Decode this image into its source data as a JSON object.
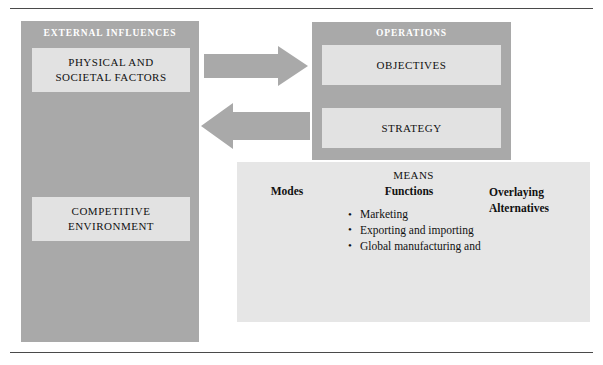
{
  "figure": {
    "rules": {
      "top": "horizontal-rule",
      "bottom": "horizontal-rule"
    }
  },
  "external_influences": {
    "title": "EXTERNAL INFLUENCES",
    "boxes": [
      {
        "id": "physical",
        "line1": "PHYSICAL AND",
        "line2": "SOCIETAL FACTORS"
      },
      {
        "id": "competitive",
        "line1": "COMPETITIVE",
        "line2": "ENVIRONMENT"
      }
    ]
  },
  "arrows": [
    {
      "name": "arrow-right",
      "direction": "right"
    },
    {
      "name": "arrow-left",
      "direction": "left"
    }
  ],
  "operations": {
    "title": "OPERATIONS",
    "boxes": [
      {
        "id": "objectives",
        "label": "OBJECTIVES"
      },
      {
        "id": "strategy",
        "label": "STRATEGY"
      }
    ]
  },
  "means": {
    "title": "MEANS",
    "modes_label": "Modes",
    "functions_label": "Functions",
    "overlaying_label_line1": "Overlaying",
    "overlaying_label_line2": "Alternatives",
    "functions": [
      "Marketing",
      "Exporting and importing",
      "Global manufacturing and",
      "supply-chain management",
      "Accounting and taxation",
      "Finance",
      "Human resources"
    ]
  },
  "colors": {
    "panel_gray": "#a9a9a9",
    "sub_box_gray": "#e2e2e2",
    "means_gray": "#e6e6e6",
    "rule": "#4a4a4a",
    "title_text": "#ffffff",
    "body_text": "#111111"
  }
}
